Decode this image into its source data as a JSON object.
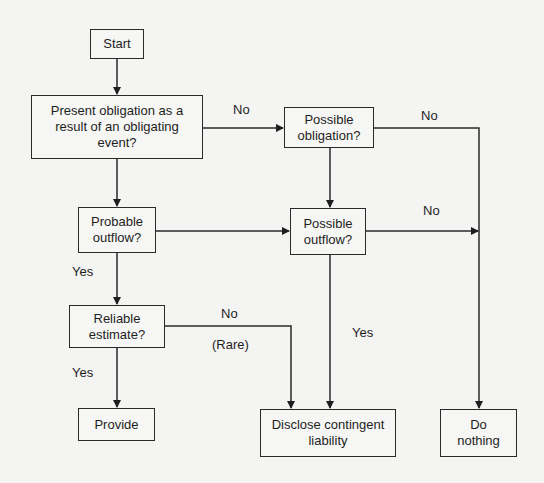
{
  "diagram": {
    "nodes": {
      "start": "Start",
      "present_obligation": "Present obligation as a result of an obligating event?",
      "possible_obligation": "Possible obligation?",
      "probable_outflow": "Probable outflow?",
      "possible_outflow": "Possible outflow?",
      "reliable_estimate": "Reliable estimate?",
      "provide": "Provide",
      "disclose": "Disclose contingent liability",
      "do_nothing": "Do nothing"
    },
    "edge_labels": {
      "present_no": "No",
      "possible_obligation_no": "No",
      "possible_outflow_no": "No",
      "probable_yes": "Yes",
      "reliable_no": "No",
      "reliable_rare": "(Rare)",
      "reliable_yes": "Yes",
      "possible_outflow_yes": "Yes"
    }
  }
}
